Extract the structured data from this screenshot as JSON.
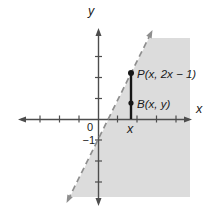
{
  "figure": {
    "colors": {
      "background": "#ffffff",
      "shaded_region": "#dcdcdc",
      "axis": "#4d4d4d",
      "dashed_line": "#8e8e8e",
      "segment_and_points": "#161616",
      "text": "#1a1a1a"
    },
    "axes": {
      "y_label": "y",
      "x_label": "x",
      "origin_label": "0",
      "y_intercept_label": "−1",
      "x_foot_label": "x"
    },
    "points": {
      "p_label": "P(x, 2x − 1)",
      "b_label": "B(x, y)"
    }
  }
}
